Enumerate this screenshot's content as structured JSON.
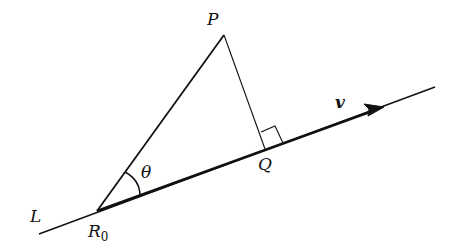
{
  "diagram": {
    "title": "",
    "labels": {
      "P": "P",
      "Q": "Q",
      "R0_main": "R",
      "R0_sub": "0",
      "L": "L",
      "v": "v",
      "theta": "θ"
    },
    "points": {
      "L_start": [
        39,
        234
      ],
      "R0": [
        97,
        211
      ],
      "P": [
        224,
        35
      ],
      "Q": [
        265,
        149
      ],
      "arrow_tip": [
        383,
        107
      ],
      "L_end": [
        435,
        87
      ]
    },
    "elements": [
      "line L through R0 and Q",
      "vector v from R0 along L (arrow)",
      "segment R0P",
      "segment PQ perpendicular to L",
      "right-angle marker at Q",
      "angle θ arc at R0 between R0P and v"
    ],
    "colors": {
      "stroke": "#111111",
      "background": "#ffffff"
    }
  }
}
